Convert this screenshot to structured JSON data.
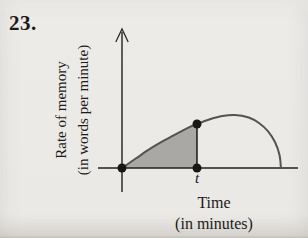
{
  "problem_number": "23.",
  "chart_data": {
    "type": "line",
    "title": "",
    "y_axis_label": [
      "Rate of memory",
      "(in words per minute)"
    ],
    "x_axis_label": [
      "Time",
      "(in minutes)"
    ],
    "t_tick_label": "t",
    "x_range": [
      0,
      100
    ],
    "y_range": [
      0,
      100
    ],
    "grid": false,
    "legend": false,
    "curve_points": [
      [
        0,
        0
      ],
      [
        8,
        7
      ],
      [
        16,
        14
      ],
      [
        24,
        20
      ],
      [
        32,
        25.5
      ],
      [
        38,
        29.5
      ],
      [
        42.6,
        31.9
      ],
      [
        50,
        35.3
      ],
      [
        57,
        37.6
      ],
      [
        64,
        38.4
      ],
      [
        72,
        36.6
      ],
      [
        78,
        32.5
      ],
      [
        83,
        26.6
      ],
      [
        87,
        18.6
      ],
      [
        89.5,
        9.4
      ],
      [
        90.3,
        0
      ]
    ],
    "shaded_region_x": [
      0,
      42.6
    ],
    "vertical_line_x": 42.6,
    "markers": [
      [
        0,
        0
      ],
      [
        42.6,
        0
      ],
      [
        42.6,
        31.9
      ]
    ],
    "colors": {
      "shade": "#aaa8a5",
      "curve": "#56534e",
      "axis": "#23201d",
      "marker": "#191715"
    }
  }
}
